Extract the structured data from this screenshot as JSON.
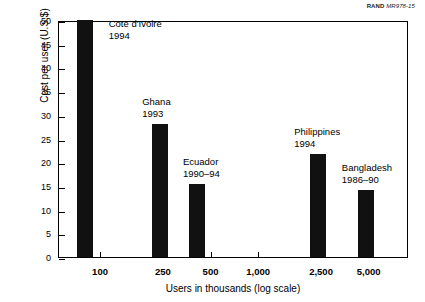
{
  "credit": {
    "organization": "RAND",
    "document_id": "MR978-15"
  },
  "chart_data": {
    "type": "bar",
    "title": "",
    "xlabel": "Users in thousands (log scale)",
    "ylabel": "Cost per user (U.S.$)",
    "ylim": [
      0,
      50
    ],
    "ytick_labels": [
      "0",
      "5",
      "10",
      "15",
      "20",
      "25",
      "30",
      "35",
      "40",
      "45",
      "50"
    ],
    "ytick_values": [
      0,
      5,
      10,
      15,
      20,
      25,
      30,
      35,
      40,
      45,
      50
    ],
    "xtick_labels": [
      "100",
      "250",
      "500",
      "1,000",
      "2,500",
      "5,000"
    ],
    "xtick_values": [
      100,
      250,
      500,
      1000,
      2500,
      5000
    ],
    "xscale": "log",
    "grid": false,
    "legend": "none",
    "bar_color": "#111111",
    "categories": [
      "Cote d'Ivoire",
      "Ghana",
      "Ecuador",
      "Philippines",
      "Bangladesh"
    ],
    "values": [
      50,
      28,
      15.3,
      21.8,
      14.2
    ],
    "points": [
      {
        "country": "Cote d'Ivoire",
        "years": "1994",
        "users_thousands": 80,
        "cost_per_user": 50
      },
      {
        "country": "Ghana",
        "years": "1993",
        "users_thousands": 240,
        "cost_per_user": 28
      },
      {
        "country": "Ecuador",
        "years": "1990–94",
        "users_thousands": 410,
        "cost_per_user": 15.3
      },
      {
        "country": "Philippines",
        "years": "1994",
        "users_thousands": 2400,
        "cost_per_user": 21.8
      },
      {
        "country": "Bangladesh",
        "years": "1986–90",
        "users_thousands": 4800,
        "cost_per_user": 14.2
      }
    ],
    "annotations": [
      {
        "line1": "Cote d'Ivoire",
        "line2": "1994"
      },
      {
        "line1": "Ghana",
        "line2": "1993"
      },
      {
        "line1": "Ecuador",
        "line2": "1990–94"
      },
      {
        "line1": "Philippines",
        "line2": "1994"
      },
      {
        "line1": "Bangladesh",
        "line2": "1986–90"
      }
    ]
  }
}
